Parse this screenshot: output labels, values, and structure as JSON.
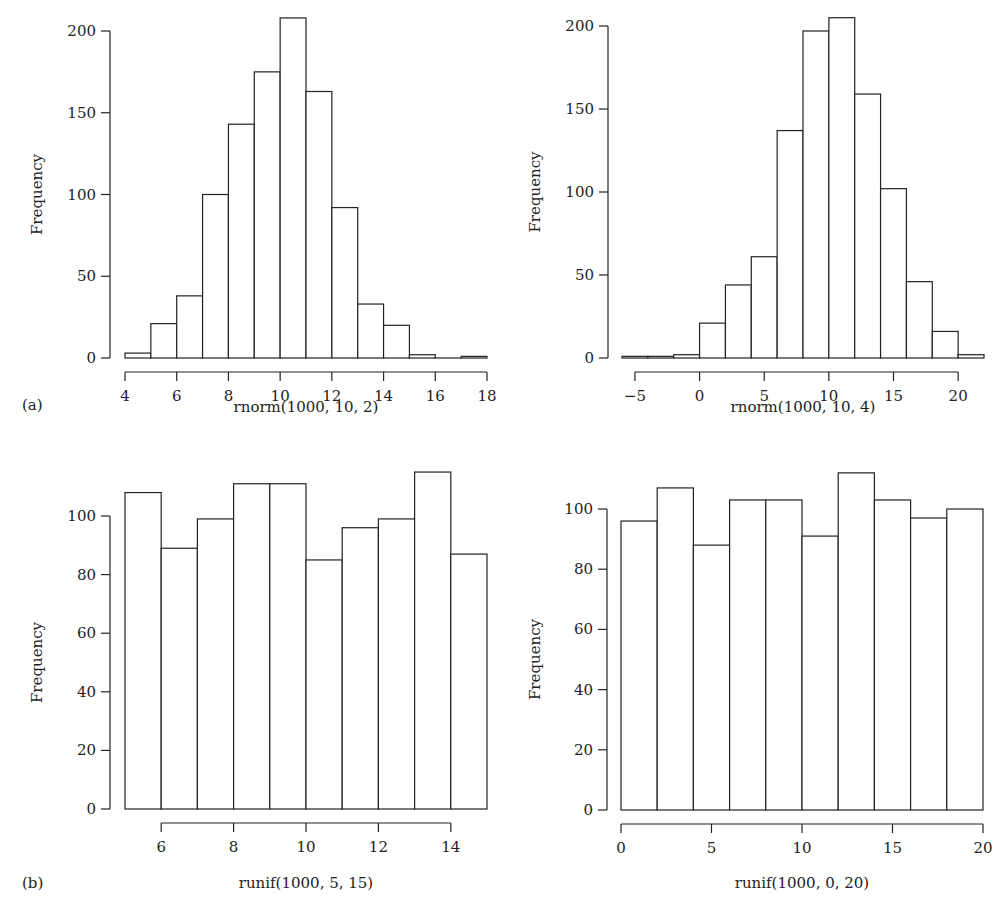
{
  "figure": {
    "panel_tags": [
      {
        "label": "(a)",
        "x": 22,
        "y": 410
      },
      {
        "label": "(b)",
        "x": 22,
        "y": 888
      }
    ]
  },
  "chart_data": [
    {
      "type": "bar",
      "subtype": "histogram",
      "title": "",
      "xlabel": "rnorm(1000, 10, 2)",
      "ylabel": "Frequency",
      "bin_edges": [
        4,
        5,
        6,
        7,
        8,
        9,
        10,
        11,
        12,
        13,
        14,
        15,
        16,
        17,
        18
      ],
      "values": [
        3,
        21,
        38,
        100,
        143,
        175,
        208,
        163,
        92,
        33,
        20,
        2,
        0,
        1
      ],
      "xticks": [
        4,
        6,
        8,
        10,
        12,
        14,
        16,
        18
      ],
      "yticks": [
        0,
        50,
        100,
        150,
        200
      ],
      "xlim": [
        4,
        18
      ],
      "ylim": [
        0,
        200
      ],
      "grid": false,
      "layout": {
        "x0": 125,
        "x1": 487,
        "xv0": 4,
        "xv1": 18,
        "ybase": 358,
        "ytop": 31,
        "yv1": 200,
        "yaxis_x": 110,
        "xaxis_y": 372,
        "xaxis_from": 4,
        "xaxis_to": 18,
        "xlabel_y": 412,
        "ylabel_x": 42
      }
    },
    {
      "type": "bar",
      "subtype": "histogram",
      "title": "",
      "xlabel": "rnorm(1000, 10, 4)",
      "ylabel": "Frequency",
      "bin_edges": [
        -6,
        -4,
        -2,
        0,
        2,
        4,
        6,
        8,
        10,
        12,
        14,
        16,
        18,
        20,
        22
      ],
      "values": [
        1,
        1,
        2,
        21,
        44,
        61,
        137,
        197,
        205,
        159,
        102,
        46,
        16,
        2
      ],
      "xticks": [
        -5,
        0,
        5,
        10,
        15,
        20
      ],
      "yticks": [
        0,
        50,
        100,
        150,
        200
      ],
      "xlim": [
        -6,
        22
      ],
      "ylim": [
        0,
        200
      ],
      "grid": false,
      "layout": {
        "x0": 622,
        "x1": 984,
        "xv0": -6,
        "xv1": 22,
        "ybase": 358,
        "ytop": 26,
        "yv1": 200,
        "yaxis_x": 608,
        "xaxis_y": 372,
        "xaxis_from": -5,
        "xaxis_to": 20,
        "xlabel_y": 412,
        "ylabel_x": 540
      }
    },
    {
      "type": "bar",
      "subtype": "histogram",
      "title": "",
      "xlabel": "runif(1000, 5, 15)",
      "ylabel": "Frequency",
      "bin_edges": [
        5,
        6,
        7,
        8,
        9,
        10,
        11,
        12,
        13,
        14,
        15
      ],
      "values": [
        108,
        89,
        99,
        111,
        111,
        85,
        96,
        99,
        115,
        87
      ],
      "xticks": [
        6,
        8,
        10,
        12,
        14
      ],
      "yticks": [
        0,
        20,
        40,
        60,
        80,
        100
      ],
      "xlim": [
        5,
        15
      ],
      "ylim": [
        0,
        115
      ],
      "grid": false,
      "layout": {
        "x0": 125,
        "x1": 487,
        "xv0": 5,
        "xv1": 15,
        "ybase": 809,
        "ytop": 516,
        "yv1": 100,
        "yaxis_x": 110,
        "xaxis_y": 823,
        "xaxis_from": 6,
        "xaxis_to": 14,
        "xlabel_y": 888,
        "ylabel_x": 42
      }
    },
    {
      "type": "bar",
      "subtype": "histogram",
      "title": "",
      "xlabel": "runif(1000, 0, 20)",
      "ylabel": "Frequency",
      "bin_edges": [
        0,
        2,
        4,
        6,
        8,
        10,
        12,
        14,
        16,
        18,
        20
      ],
      "values": [
        96,
        107,
        88,
        103,
        103,
        91,
        112,
        103,
        97,
        100
      ],
      "xticks": [
        0,
        5,
        10,
        15,
        20
      ],
      "yticks": [
        0,
        20,
        40,
        60,
        80,
        100
      ],
      "xlim": [
        0,
        20
      ],
      "ylim": [
        0,
        112
      ],
      "grid": false,
      "layout": {
        "x0": 621,
        "x1": 983,
        "xv0": 0,
        "xv1": 20,
        "ybase": 810,
        "ytop": 509,
        "yv1": 100,
        "yaxis_x": 607,
        "xaxis_y": 824,
        "xaxis_from": 0,
        "xaxis_to": 20,
        "xlabel_y": 888,
        "ylabel_x": 540
      }
    }
  ]
}
